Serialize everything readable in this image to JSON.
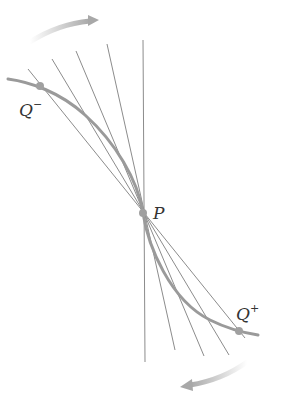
{
  "diagram": {
    "colors": {
      "curve": "#9a9a9a",
      "lines": "#8c8c8c",
      "points": "#a0a0a0",
      "arrows": "#a8a8a8",
      "text": "#333333"
    },
    "points": {
      "P": {
        "label": "P",
        "x": 143,
        "y": 213
      },
      "Q_minus": {
        "label": "Q",
        "superscript": "−",
        "x": 40,
        "y": 86
      },
      "Q_plus": {
        "label": "Q",
        "superscript": "+",
        "x": 239,
        "y": 331
      }
    },
    "secant_lines": [
      {
        "x1": 28,
        "y1": 69,
        "x2": 245,
        "y2": 338
      },
      {
        "x1": 52,
        "y1": 59,
        "x2": 229,
        "y2": 355
      },
      {
        "x1": 76,
        "y1": 51,
        "x2": 204,
        "y2": 356
      },
      {
        "x1": 107,
        "y1": 44,
        "x2": 175,
        "y2": 350
      },
      {
        "x1": 143,
        "y1": 40,
        "x2": 145,
        "y2": 362
      }
    ],
    "arrows": [
      {
        "name": "top-rotation-arrow",
        "direction": "clockwise"
      },
      {
        "name": "bottom-rotation-arrow",
        "direction": "clockwise"
      }
    ]
  }
}
